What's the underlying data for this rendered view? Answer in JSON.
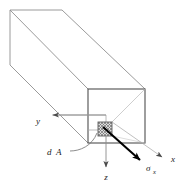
{
  "figure": {
    "type": "engineering-diagram",
    "background_color": "#ffffff",
    "geometry": {
      "prism_line_color": "#8c8c8c",
      "front_face_line_color": "#4d4d4d",
      "axis_line_color": "#8c8c8c",
      "stress_arrow_color": "#000000",
      "hatch_color": "#6b6b6b",
      "hatch_fill": "#d9d9d9",
      "front_face": {
        "x": 88,
        "y": 89,
        "width": 57,
        "height": 54
      },
      "dA_patch": {
        "x": 98,
        "y": 122,
        "width": 14,
        "height": 14
      },
      "back_face": {
        "x": 10,
        "y": 10,
        "width": 52,
        "height": 55
      }
    },
    "labels": {
      "y_axis": "y",
      "z_axis": "z",
      "x_axis": "x",
      "area_element": "d",
      "area_element_symbol": "A",
      "stress_symbol": "σ",
      "stress_subscript": "x"
    },
    "axes": [
      {
        "name": "y-axis",
        "label": "y",
        "direction": "left",
        "tip": {
          "x": 52,
          "y": 115
        }
      },
      {
        "name": "z-axis",
        "label": "z",
        "direction": "down",
        "tip": {
          "x": 105,
          "y": 166
        }
      },
      {
        "name": "x-axis",
        "label": "x",
        "direction": "down-right",
        "tip": {
          "x": 163,
          "y": 157
        }
      }
    ],
    "annotations": [
      {
        "name": "stress-vector",
        "label": "σx",
        "from": {
          "x": 106,
          "y": 130
        },
        "to": {
          "x": 143,
          "y": 162
        }
      },
      {
        "name": "area-leader",
        "label": "dA",
        "from": {
          "x": 68,
          "y": 150
        },
        "to": {
          "x": 98,
          "y": 131
        }
      }
    ]
  }
}
